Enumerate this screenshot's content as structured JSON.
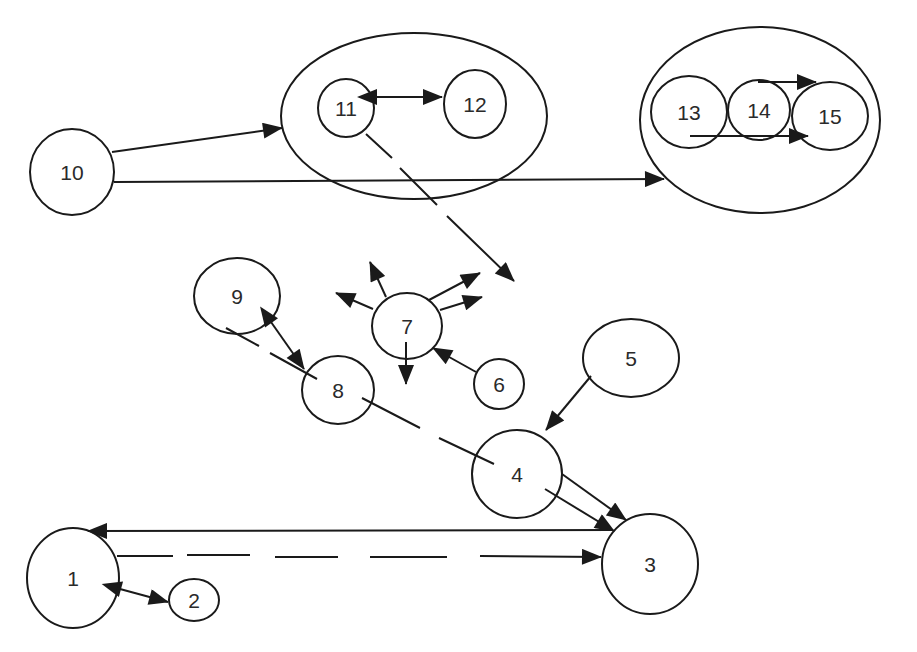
{
  "diagram": {
    "type": "node-link",
    "stroke_color": "#1a1a1a",
    "background": "#ffffff",
    "nodes": [
      {
        "id": "1",
        "label": "1",
        "cx": 73,
        "cy": 578,
        "rx": 46,
        "ry": 50
      },
      {
        "id": "2",
        "label": "2",
        "cx": 194,
        "cy": 600,
        "rx": 25,
        "ry": 21
      },
      {
        "id": "3",
        "label": "3",
        "cx": 650,
        "cy": 564,
        "rx": 48,
        "ry": 50
      },
      {
        "id": "4",
        "label": "4",
        "cx": 517,
        "cy": 474,
        "rx": 45,
        "ry": 44
      },
      {
        "id": "5",
        "label": "5",
        "cx": 631,
        "cy": 358,
        "rx": 48,
        "ry": 39
      },
      {
        "id": "6",
        "label": "6",
        "cx": 499,
        "cy": 384,
        "rx": 25,
        "ry": 25
      },
      {
        "id": "7",
        "label": "7",
        "cx": 407,
        "cy": 326,
        "rx": 35,
        "ry": 33
      },
      {
        "id": "8",
        "label": "8",
        "cx": 338,
        "cy": 390,
        "rx": 36,
        "ry": 34
      },
      {
        "id": "9",
        "label": "9",
        "cx": 237,
        "cy": 296,
        "rx": 43,
        "ry": 38
      },
      {
        "id": "10",
        "label": "10",
        "cx": 72,
        "cy": 172,
        "rx": 42,
        "ry": 43
      },
      {
        "id": "11",
        "label": "11",
        "cx": 346,
        "cy": 108,
        "rx": 28,
        "ry": 29
      },
      {
        "id": "12",
        "label": "12",
        "cx": 475,
        "cy": 104,
        "rx": 31,
        "ry": 34
      },
      {
        "id": "13",
        "label": "13",
        "cx": 689,
        "cy": 112,
        "rx": 38,
        "ry": 36
      },
      {
        "id": "14",
        "label": "14",
        "cx": 759,
        "cy": 110,
        "rx": 31,
        "ry": 30
      },
      {
        "id": "15",
        "label": "15",
        "cx": 830,
        "cy": 116,
        "rx": 38,
        "ry": 34
      }
    ],
    "groups": [
      {
        "id": "group-11-12",
        "members": [
          "11",
          "12"
        ],
        "cx": 414,
        "cy": 116,
        "rx": 133,
        "ry": 83
      },
      {
        "id": "group-13-14-15",
        "members": [
          "13",
          "14",
          "15"
        ],
        "cx": 760,
        "cy": 120,
        "rx": 120,
        "ry": 93
      }
    ],
    "edges": [
      {
        "from": "10",
        "to": "group-11-12",
        "style": "solid",
        "direction": "forward"
      },
      {
        "from": "10",
        "to": "group-13-14-15",
        "style": "solid",
        "direction": "forward"
      },
      {
        "from": "11",
        "to": "12",
        "style": "solid",
        "direction": "both"
      },
      {
        "from": "13",
        "to": "15",
        "style": "solid",
        "direction": "forward",
        "note": "upper arrow over 14"
      },
      {
        "from": "13",
        "to": "15",
        "style": "solid",
        "direction": "forward",
        "note": "lower arrow through 14"
      },
      {
        "from": "11",
        "to": "outside",
        "style": "dashed",
        "direction": "forward"
      },
      {
        "from": "7",
        "to": "outside",
        "style": "solid",
        "direction": "forward",
        "count": 5
      },
      {
        "from": "6",
        "to": "7",
        "style": "solid",
        "direction": "forward"
      },
      {
        "from": "9",
        "to": "8",
        "style": "solid",
        "direction": "both"
      },
      {
        "from": "9",
        "to": "4",
        "style": "dashed",
        "direction": "none",
        "note": "passes through 8"
      },
      {
        "from": "5",
        "to": "4",
        "style": "solid",
        "direction": "forward"
      },
      {
        "from": "4",
        "to": "3",
        "style": "solid",
        "direction": "forward",
        "count": 2
      },
      {
        "from": "3",
        "to": "1",
        "style": "solid",
        "direction": "forward"
      },
      {
        "from": "1",
        "to": "3",
        "style": "dashed",
        "direction": "forward"
      },
      {
        "from": "1",
        "to": "2",
        "style": "solid",
        "direction": "both"
      }
    ]
  }
}
